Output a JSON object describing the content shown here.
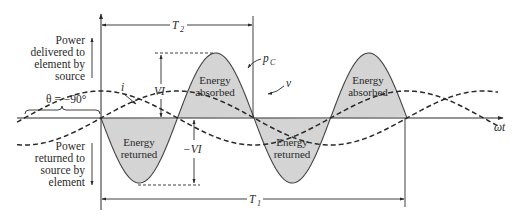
{
  "diagram": {
    "labels": {
      "delivered": [
        "Power",
        "delivered to",
        "element by",
        "source"
      ],
      "returned": [
        "Power",
        "returned to",
        "source by",
        "element"
      ],
      "theta": "θ = −90°",
      "i": "i",
      "v": "v",
      "pc": "p",
      "pc_sub": "C",
      "vi": "VI",
      "neg_vi": "−VI",
      "t2": "T",
      "t2_sub": "2",
      "t1": "T",
      "t1_sub": "1",
      "omega_t": "ωt",
      "absorbed": [
        "Energy",
        "absorbed"
      ],
      "returned_region": [
        "Energy",
        "returned"
      ]
    },
    "colors": {
      "line": "#2a2a2a",
      "fill": "#d4d4d4",
      "background": "#ffffff"
    },
    "geometry": {
      "axis_y": 118,
      "origin_x": 101,
      "power_half_period_px": 76.5,
      "power_amplitude_px": 65,
      "vi_amplitude_px": 27,
      "x_start": 17,
      "x_end": 500
    }
  }
}
